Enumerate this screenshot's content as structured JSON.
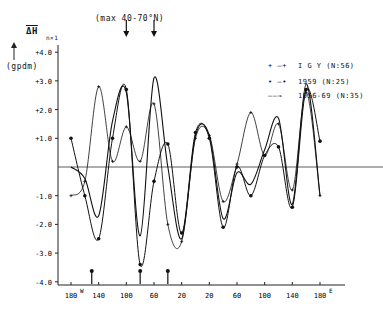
{
  "chart_data": {
    "type": "line",
    "title": "(max 40-70°N)",
    "ylabel": "ΔH n×1 (gpdm)",
    "ylabel_top": "ΔH",
    "ylabel_sub": "n×1",
    "ylabel_unit": "(gpdm)",
    "xlabel": "Longitude",
    "ylim": [
      -4.0,
      4.0
    ],
    "yticks": [
      "+4.0",
      "+3.0",
      "+2.0",
      "+1.0",
      "-1.0",
      "-2.0",
      "-3.0",
      "-4.0"
    ],
    "xticks": [
      "180W",
      "140",
      "100",
      "60",
      "20",
      "20",
      "60",
      "100",
      "140",
      "180E"
    ],
    "x": [
      -180,
      -160,
      -140,
      -120,
      -100,
      -80,
      -60,
      -40,
      -20,
      0,
      20,
      40,
      60,
      80,
      100,
      120,
      140,
      160,
      180
    ],
    "series": [
      {
        "name": "I G Y (N:56)",
        "marker": "+",
        "values": [
          -1.0,
          -0.5,
          2.8,
          0.2,
          1.4,
          0.2,
          2.2,
          -2.0,
          -2.6,
          1.0,
          1.1,
          -1.2,
          0.1,
          1.9,
          0.4,
          1.5,
          -0.8,
          2.6,
          -1.0
        ]
      },
      {
        "name": "1959 (N:25)",
        "marker": "•",
        "values": [
          1.0,
          -1.0,
          -2.5,
          1.0,
          2.7,
          -3.4,
          -0.5,
          0.8,
          -2.3,
          1.2,
          1.0,
          -2.1,
          0.0,
          -1.0,
          0.4,
          0.7,
          -1.4,
          2.7,
          0.9
        ]
      },
      {
        "name": "1956-69 (N:35)",
        "marker": "",
        "values": [
          0.0,
          -0.4,
          -1.7,
          1.6,
          2.6,
          -2.4,
          3.1,
          0.0,
          -2.5,
          1.1,
          1.1,
          -1.8,
          -0.2,
          -0.6,
          0.6,
          1.7,
          -1.3,
          2.9,
          -1.0
        ]
      }
    ],
    "legend_position": "upper right",
    "grid": false,
    "arrows_down_at": [
      -100,
      -60
    ],
    "arrows_up_at": [
      -150,
      -80,
      -40
    ]
  },
  "legend": [
    {
      "symbol": "+ —+",
      "label": "I G Y  (N:56)"
    },
    {
      "symbol": "• —•",
      "label": "1959  (N:25)"
    },
    {
      "symbol": "——→",
      "label": "1956-69 (N:35)"
    }
  ],
  "labels": {
    "top": "(max 40-70°N)",
    "dh": "ΔH",
    "sub": "n×1",
    "unit": "(gpdm)"
  }
}
